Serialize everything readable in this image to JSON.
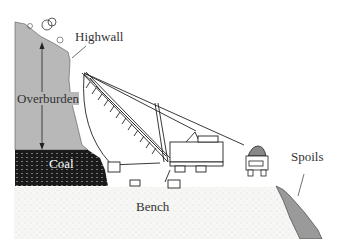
{
  "diagram": {
    "type": "surface mining cross-section (strip mine with dragline)",
    "labels": {
      "highwall": "Highwall",
      "overburden": "Overburden",
      "coal": "Coal",
      "bench": "Bench",
      "spoils": "Spoils"
    },
    "colors": {
      "overburden_fill": "#b8b8b8",
      "coal_fill": "#1a1a1a",
      "ground_fill": "#f4f4f2",
      "line": "#222222",
      "text": "#333333"
    }
  }
}
